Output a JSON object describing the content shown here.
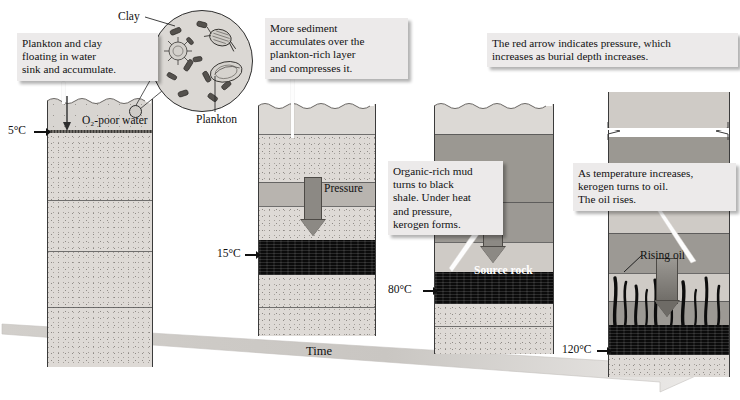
{
  "figure": {
    "time_axis_label": "Time",
    "stage_count": 4
  },
  "callouts": [
    {
      "id": "callout-plankton-clay",
      "text": "Plankton and clay\nfloating in water\nsink and accumulate."
    },
    {
      "id": "callout-more-sediment",
      "text": "More sediment\naccumulates over the\nplankton-rich layer\nand compresses it."
    },
    {
      "id": "callout-red-arrow",
      "text": "The red arrow indicates pressure, which\nincreases as burial depth increases."
    },
    {
      "id": "callout-organic-mud",
      "text": "Organic-rich mud\nturns to black\nshale. Under heat\nand pressure,\nkerogen forms."
    },
    {
      "id": "callout-kerogen-oil",
      "text": "As temperature increases,\nkerogen turns to oil.\nThe oil rises."
    }
  ],
  "inset": {
    "clay_label": "Clay",
    "plankton_label": "Plankton"
  },
  "panels": [
    {
      "id": "panel-1",
      "temperature": "5°C",
      "water_label": "O₂-poor water",
      "pressure_label": null,
      "rock_label": null
    },
    {
      "id": "panel-2",
      "temperature": "15°C",
      "water_label": null,
      "pressure_label": "Pressure",
      "rock_label": null
    },
    {
      "id": "panel-3",
      "temperature": "80°C",
      "water_label": null,
      "pressure_label": null,
      "rock_label": "Source rock"
    },
    {
      "id": "panel-4",
      "temperature": "120°C",
      "water_label": null,
      "pressure_label": null,
      "rock_label": "Rising oil"
    }
  ],
  "colors": {
    "background": "#ffffff",
    "callout_fill": "#eceaea",
    "sediment_light": "#dedad6",
    "sediment_mid": "#cfcbc6",
    "sediment_dark": "#9b9892",
    "shale_black": "#0b0b0b",
    "arrow_grey": "#8c8984",
    "outline": "#3b3b3b",
    "text": "#111111"
  }
}
